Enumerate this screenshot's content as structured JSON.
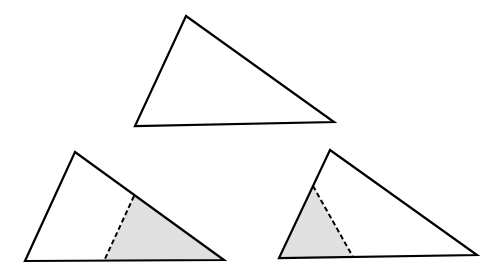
{
  "diagram": {
    "colors": {
      "stroke": "#000000",
      "fill": "#ffffff",
      "shade": "#e0e0e0"
    },
    "triangles": [
      {
        "id": "top",
        "points": [
          [
            186,
            16
          ],
          [
            135,
            126
          ],
          [
            334,
            122
          ]
        ],
        "shaded": null,
        "dashed": null
      },
      {
        "id": "bottom-left",
        "points": [
          [
            75,
            152
          ],
          [
            25,
            261
          ],
          [
            224,
            260
          ]
        ],
        "shaded": [
          [
            134,
            196
          ],
          [
            104,
            261
          ],
          [
            224,
            260
          ]
        ],
        "dashed": [
          [
            134,
            196
          ],
          [
            104,
            261
          ]
        ]
      },
      {
        "id": "bottom-right",
        "points": [
          [
            330,
            150
          ],
          [
            279,
            258
          ],
          [
            477,
            255
          ]
        ],
        "shaded": [
          [
            313,
            186
          ],
          [
            279,
            258
          ],
          [
            353,
            257
          ]
        ],
        "dashed": [
          [
            313,
            186
          ],
          [
            353,
            257
          ]
        ]
      }
    ]
  }
}
